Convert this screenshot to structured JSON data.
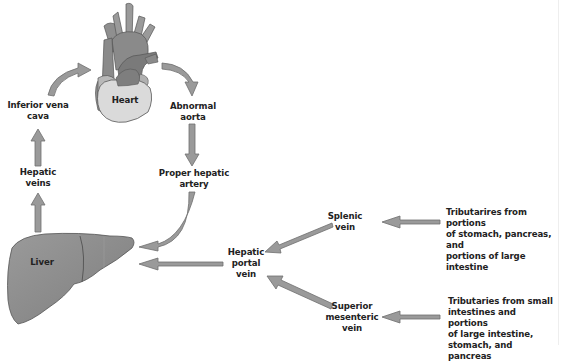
{
  "colors": {
    "arrow_fill": "#9a9a9a",
    "arrow_stroke": "#6e6e6e",
    "liver_fill": "#8c8c8c",
    "heart_dark": "#8a8a8a",
    "heart_light": "#dadada",
    "text": "#222222"
  },
  "nodes": {
    "heart": "Heart",
    "inferior_vena_cava": "Inferior vena\ncava",
    "abnormal_aorta": "Abnormal\naorta",
    "hepatic_veins": "Hepatic\nveins",
    "proper_hepatic_artery": "Proper hepatic\nartery",
    "liver": "Liver",
    "hepatic_portal_vein": "Hepatic\nportal\nvein",
    "splenic_vein": "Splenic\nvein",
    "superior_mesenteric_vein": "Superior\nmesenteric\nvein",
    "tributaries_splenic": "Tributarires from portions\nof stomach, pancreas, and\nportions of large intestine",
    "tributaries_mesenteric": "Tributaries from small\nintestines and portions\nof large intestine,\nstomach, and pancreas"
  },
  "edges": [
    {
      "from": "liver",
      "to": "hepatic_veins"
    },
    {
      "from": "hepatic_veins",
      "to": "inferior_vena_cava"
    },
    {
      "from": "inferior_vena_cava",
      "to": "heart"
    },
    {
      "from": "heart",
      "to": "abnormal_aorta"
    },
    {
      "from": "abnormal_aorta",
      "to": "proper_hepatic_artery"
    },
    {
      "from": "proper_hepatic_artery",
      "to": "liver"
    },
    {
      "from": "hepatic_portal_vein",
      "to": "liver"
    },
    {
      "from": "splenic_vein",
      "to": "hepatic_portal_vein"
    },
    {
      "from": "superior_mesenteric_vein",
      "to": "hepatic_portal_vein"
    },
    {
      "from": "tributaries_splenic",
      "to": "splenic_vein"
    },
    {
      "from": "tributaries_mesenteric",
      "to": "superior_mesenteric_vein"
    }
  ]
}
